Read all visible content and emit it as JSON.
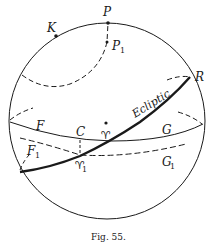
{
  "figure": {
    "caption": "Fig. 55.",
    "labels": {
      "P": "P",
      "K": "K",
      "P1_main": "P",
      "P1_sub": "1",
      "R": "R",
      "ecliptic": "Ecliptic",
      "F": "F",
      "F1_main": "F",
      "F1_sub": "1",
      "C": "C",
      "aries": "♈",
      "aries1_main": "♈",
      "aries1_sub": "1",
      "G": "G",
      "G1_main": "G",
      "G1_sub": "1"
    },
    "colors": {
      "ink": "#1a1a1a",
      "background": "#ffffff"
    }
  }
}
